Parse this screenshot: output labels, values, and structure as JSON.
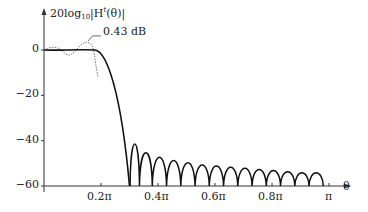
{
  "chart_data": {
    "type": "line",
    "title_parts": {
      "pre": "20log",
      "sub": "10",
      "mid": "|H",
      "sup": "t",
      "post": "(θ)|"
    },
    "xlabel": "θ",
    "ylabel": "20log10|H^t(θ)|",
    "xlim": [
      0,
      1.1
    ],
    "ylim": [
      -62,
      8
    ],
    "grid": false,
    "legend": "none",
    "x_ticks": [
      {
        "value": 0.2,
        "label": "0.2π"
      },
      {
        "value": 0.4,
        "label": "0.4π"
      },
      {
        "value": 0.6,
        "label": "0.6π"
      },
      {
        "value": 0.8,
        "label": "0.8π"
      },
      {
        "value": 1.0,
        "label": "π"
      }
    ],
    "y_ticks": [
      {
        "value": 0,
        "label": "0"
      },
      {
        "value": -20,
        "label": "−20"
      },
      {
        "value": -40,
        "label": "−40"
      },
      {
        "value": -60,
        "label": "−60"
      }
    ],
    "annotation": {
      "text": "0.43 dB",
      "x": 0.19,
      "y": 3.5
    },
    "series": [
      {
        "name": "windowed response (solid)",
        "style": "solid",
        "x": [
          0,
          0.05,
          0.1,
          0.15,
          0.18,
          0.2,
          0.22,
          0.24,
          0.26,
          0.28,
          0.3
        ],
        "y": [
          0,
          -0.1,
          0,
          0.1,
          0,
          -1,
          -4,
          -10,
          -20,
          -35,
          -60
        ]
      },
      {
        "name": "unwindowed passband ripple (dotted)",
        "style": "dotted",
        "x": [
          0,
          0.03,
          0.06,
          0.09,
          0.12,
          0.15,
          0.17,
          0.19
        ],
        "y": [
          0,
          1.5,
          0,
          -3,
          0,
          3.5,
          0,
          -10
        ]
      }
    ],
    "sidelobe_peaks": {
      "x": [
        0.315,
        0.355,
        0.405,
        0.455,
        0.505,
        0.555,
        0.605,
        0.655,
        0.705,
        0.755,
        0.805,
        0.855,
        0.905,
        0.955
      ],
      "y": [
        -41,
        -45,
        -47,
        -48.5,
        -49.5,
        -50.5,
        -51,
        -51.5,
        -52,
        -52.5,
        -53,
        -53.5,
        -54,
        -54
      ]
    }
  }
}
